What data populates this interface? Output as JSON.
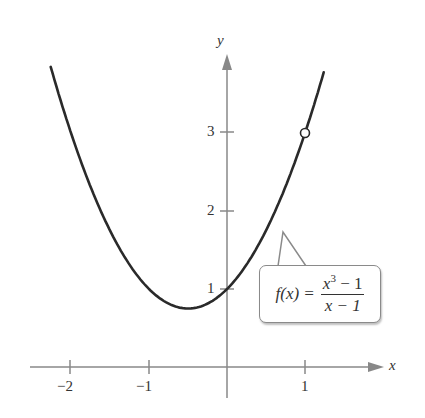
{
  "chart_data": {
    "type": "line",
    "title": "",
    "function": "f(x) = (x^3 - 1)/(x - 1)",
    "simplified": "x^2 + x + 1, x != 1",
    "xlabel": "x",
    "ylabel": "y",
    "x_ticks": [
      "-2",
      "-1",
      "1"
    ],
    "y_ticks": [
      "1",
      "2",
      "3"
    ],
    "xlim": [
      -2.26,
      1.24
    ],
    "ylim": [
      0,
      3.85
    ],
    "grid": false,
    "hole": {
      "x": 1,
      "y": 3,
      "style": "open circle"
    },
    "minimum": {
      "x": -0.5,
      "y": 0.75
    },
    "series": [
      {
        "name": "f(x)",
        "x": [
          -2.25,
          -2,
          -1.5,
          -1,
          -0.5,
          0,
          0.5,
          1,
          1.24
        ],
        "y": [
          3.81,
          3,
          1.75,
          1,
          0.75,
          1,
          1.75,
          3,
          3.78
        ]
      }
    ]
  },
  "labels": {
    "x_axis": "x",
    "y_axis": "y",
    "x_tick_neg2": "−2",
    "x_tick_neg1": "−1",
    "x_tick_1": "1",
    "y_tick_1": "1",
    "y_tick_2": "2",
    "y_tick_3": "3"
  },
  "callout": {
    "lhs": "f(x) =",
    "numerator_base": "x",
    "numerator_exp": "3",
    "numerator_rest": " − 1",
    "denominator": "x − 1"
  },
  "colors": {
    "axis": "#888888",
    "curve": "#2a2a2a",
    "text": "#333333"
  }
}
